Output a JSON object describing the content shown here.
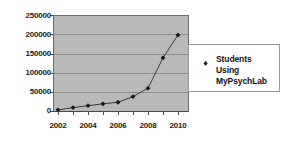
{
  "chart_data": {
    "type": "line",
    "title": "",
    "xlabel": "",
    "ylabel": "",
    "categories": [
      2002,
      2003,
      2004,
      2005,
      2006,
      2007,
      2008,
      2009,
      2010
    ],
    "x_tick_labels": [
      "2002",
      "2004",
      "2006",
      "2008",
      "2010"
    ],
    "y_tick_labels": [
      "0",
      "50000",
      "100000",
      "150000",
      "200000",
      "250000"
    ],
    "y_ticks": [
      0,
      50000,
      100000,
      150000,
      200000,
      250000
    ],
    "ylim": [
      0,
      250000
    ],
    "xlim": [
      2001.5,
      2010.5
    ],
    "grid": "horizontal",
    "legend_position": "right",
    "series": [
      {
        "name": "Students Using MyPsychLab",
        "marker": "diamond",
        "values": [
          3000,
          9000,
          14000,
          19000,
          23000,
          38000,
          60000,
          140000,
          200000
        ]
      }
    ],
    "colors": {
      "plot_background": "#b9b9b9",
      "gridline": "#8d8d8d",
      "axis": "#4a4a4a",
      "series": "#161616",
      "figure_background": "#ffffff",
      "text": "#1b1b1b"
    }
  },
  "legend": {
    "marker_glyph": "♦",
    "lines": [
      "Students",
      "Using",
      "MyPsychLab"
    ],
    "line0": "Students",
    "line1": "Using",
    "line2": "MyPsychLab"
  },
  "axes": {
    "y": {
      "t0": "0",
      "t1": "50000",
      "t2": "100000",
      "t3": "150000",
      "t4": "200000",
      "t5": "250000"
    },
    "x": {
      "t0": "2002",
      "t1": "2004",
      "t2": "2006",
      "t3": "2008",
      "t4": "2010"
    }
  }
}
